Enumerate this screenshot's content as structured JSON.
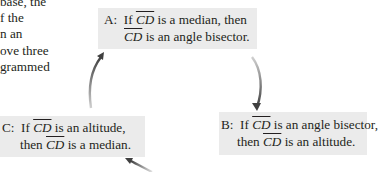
{
  "body_text": {
    "lines": [
      "base, the",
      "f the",
      "n an",
      "ove three",
      "grammed"
    ]
  },
  "diagram": {
    "nodes": [
      {
        "id": "A",
        "label": "A:",
        "line1_prefix": "If ",
        "line1_segment": "CD",
        "line1_suffix": " is a median, then",
        "line2_segment": "CD",
        "line2_suffix": " is an angle bisector."
      },
      {
        "id": "B",
        "label": "B:",
        "line1_prefix": "If ",
        "line1_segment": "CD",
        "line1_suffix": " is an angle bisector,",
        "line2_prefix": "then ",
        "line2_segment": "CD",
        "line2_suffix": " is an altitude."
      },
      {
        "id": "C",
        "label": "C:",
        "line1_prefix": "If ",
        "line1_segment": "CD",
        "line1_suffix": " is an altitude,",
        "line2_prefix": "then ",
        "line2_segment": "CD",
        "line2_suffix": " is a median."
      }
    ],
    "edges": [
      {
        "from": "A",
        "to": "B"
      },
      {
        "from": "B",
        "to": "C"
      },
      {
        "from": "C",
        "to": "A"
      }
    ],
    "colors": {
      "box_fill": "#ebebeb",
      "arrow": "#4a4a4a",
      "text": "#231f20"
    }
  }
}
